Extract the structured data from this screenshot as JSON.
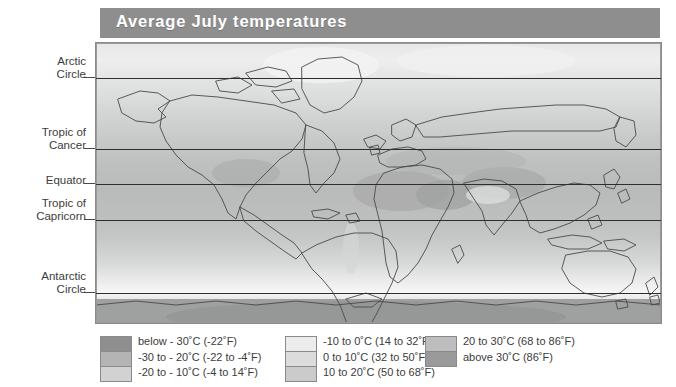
{
  "title": {
    "text": "Average July temperatures"
  },
  "map": {
    "projection": "equirectangular world map",
    "latitude_lines": [
      {
        "name": "arctic-circle",
        "label": "Arctic\nCircle",
        "y": 77
      },
      {
        "name": "tropic-of-cancer",
        "label": "Tropic of\nCancer",
        "y": 148
      },
      {
        "name": "equator",
        "label": "Equator",
        "y": 183
      },
      {
        "name": "tropic-of-capricorn",
        "label": "Tropic of\nCapricorn",
        "y": 219
      },
      {
        "name": "antarctic-circle",
        "label": "Antarctic\nCircle",
        "y": 292
      }
    ]
  },
  "legend": {
    "columns": [
      {
        "swatch_colors": [
          "#8f8f8f",
          "#b4b4b4",
          "#d2d2d2"
        ],
        "labels": [
          "below - 30˚C (-22˚F)",
          "-30 to - 20˚C (-22 to -4˚F)",
          "-20 to - 10˚C (-4 to 14˚F)"
        ]
      },
      {
        "swatch_colors": [
          "#ececec",
          "#dcdcdc",
          "#cbcbcb"
        ],
        "labels": [
          "-10 to 0˚C (14 to 32˚F)",
          "0 to 10˚C (32 to 50˚F)",
          "10 to 20˚C (50 to 68˚F)"
        ]
      },
      {
        "swatch_colors": [
          "#bdbdbd",
          "#9a9a9a"
        ],
        "labels": [
          "20 to 30˚C (68 to 86˚F)",
          "above 30˚C (86˚F)"
        ]
      }
    ]
  },
  "chart_data": {
    "type": "map",
    "title": "Average July temperatures",
    "variable": "Mean surface air temperature, July",
    "units": "°C (°F)",
    "legend_position": "bottom",
    "bands": [
      {
        "range_c": "below -30",
        "range_f": "below -22",
        "color": "#8f8f8f"
      },
      {
        "range_c": "-30 to -20",
        "range_f": "-22 to -4",
        "color": "#b4b4b4"
      },
      {
        "range_c": "-20 to -10",
        "range_f": "-4 to 14",
        "color": "#d2d2d2"
      },
      {
        "range_c": "-10 to 0",
        "range_f": "14 to 32",
        "color": "#ececec"
      },
      {
        "range_c": "0 to 10",
        "range_f": "32 to 50",
        "color": "#dcdcdc"
      },
      {
        "range_c": "10 to 20",
        "range_f": "50 to 68",
        "color": "#cbcbcb"
      },
      {
        "range_c": "20 to 30",
        "range_f": "68 to 86",
        "color": "#bdbdbd"
      },
      {
        "range_c": "above 30",
        "range_f": "above 86",
        "color": "#9a9a9a"
      }
    ],
    "reference_lines": [
      "Arctic Circle",
      "Tropic of Cancer",
      "Equator",
      "Tropic of Capricorn",
      "Antarctic Circle"
    ]
  }
}
